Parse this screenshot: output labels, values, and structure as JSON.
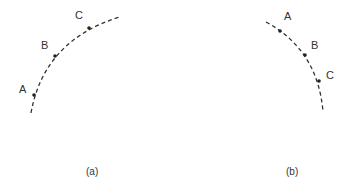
{
  "diagram": {
    "panels": [
      {
        "id": "a",
        "caption": "(a)",
        "curve": {
          "description": "dashed arc concave down-right, rising from bottom-left to top-right",
          "path": "M31,113 Q44,40 120,17"
        },
        "points": [
          {
            "label": "A",
            "x": 34,
            "y": 95,
            "label_x": 19,
            "label_y": 93
          },
          {
            "label": "B",
            "x": 55,
            "y": 56,
            "label_x": 41,
            "label_y": 49
          },
          {
            "label": "C",
            "x": 89,
            "y": 28,
            "label_x": 75,
            "label_y": 19
          }
        ],
        "caption_x": 92,
        "caption_y": 175
      },
      {
        "id": "b",
        "caption": "(b)",
        "curve": {
          "description": "dashed arc concave down-left, descending from top-left to bottom-right",
          "path": "M266,22 Q318,50 323,112"
        },
        "points": [
          {
            "label": "A",
            "x": 280,
            "y": 31,
            "label_x": 284,
            "label_y": 20
          },
          {
            "label": "B",
            "x": 305,
            "y": 55,
            "label_x": 311,
            "label_y": 49
          },
          {
            "label": "C",
            "x": 319,
            "y": 81,
            "label_x": 326,
            "label_y": 79
          }
        ],
        "caption_x": 292,
        "caption_y": 175
      }
    ],
    "colors": {
      "stroke": "#333333",
      "point": "#222222",
      "text": "#333333",
      "background": "#ffffff"
    }
  }
}
